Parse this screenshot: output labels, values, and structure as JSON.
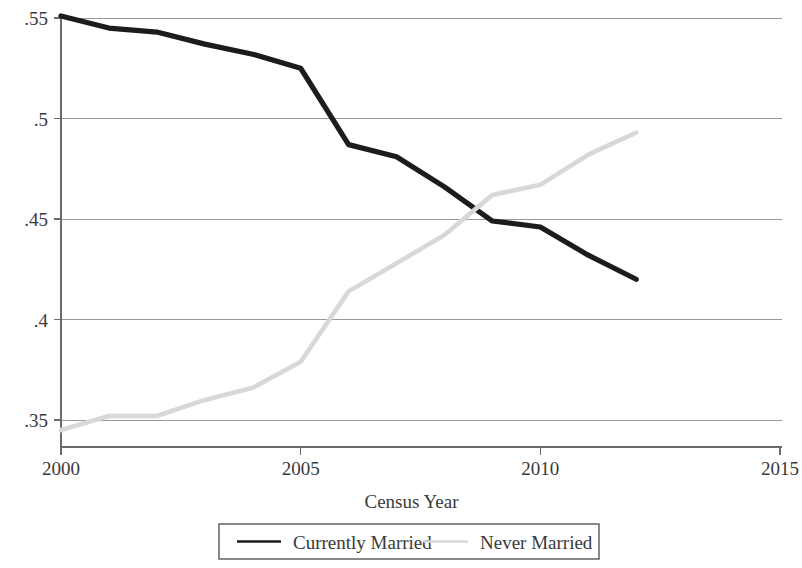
{
  "chart_data": {
    "type": "line",
    "title": "",
    "subtitle": "",
    "xlabel": "Census Year",
    "ylabel": "",
    "x": [
      2000,
      2001,
      2002,
      2003,
      2004,
      2005,
      2006,
      2007,
      2008,
      2009,
      2010,
      2011,
      2012
    ],
    "xlim": [
      2000,
      2015
    ],
    "ylim": [
      0.335,
      0.5545
    ],
    "xticks": [
      2000,
      2005,
      2010,
      2015
    ],
    "xtick_labels": [
      "2000",
      "2005",
      "2010",
      "2015"
    ],
    "yticks": [
      0.35,
      0.4,
      0.45,
      0.5,
      0.55
    ],
    "ytick_labels": [
      ".35",
      ".4",
      ".45",
      ".5",
      ".55"
    ],
    "grid": "horizontal",
    "legend_position": "bottom-center",
    "series": [
      {
        "name": "Currently Married",
        "color": "#1c1c1c",
        "width": 5.2,
        "values": [
          0.551,
          0.545,
          0.543,
          0.537,
          0.532,
          0.525,
          0.487,
          0.481,
          0.466,
          0.449,
          0.446,
          0.432,
          0.42
        ]
      },
      {
        "name": "Never Married",
        "color": "#d8d8d8",
        "width": 4.6,
        "values": [
          0.345,
          0.352,
          0.352,
          0.36,
          0.366,
          0.379,
          0.414,
          0.428,
          0.442,
          0.462,
          0.467,
          0.482,
          0.493
        ]
      }
    ],
    "annotations": []
  },
  "legend": {
    "entries": [
      {
        "label": "Currently Married",
        "color": "#1c1c1c"
      },
      {
        "label": "Never Married",
        "color": "#d8d8d8"
      }
    ]
  },
  "axes": {
    "x_title": "Census Year"
  }
}
